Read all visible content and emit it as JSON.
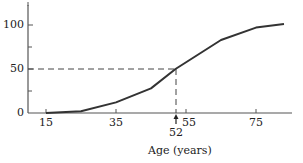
{
  "chart_data": {
    "type": "line",
    "title": "",
    "xlabel": "Age (years)",
    "ylabel": "",
    "xlim": [
      15,
      83
    ],
    "ylim": [
      0,
      100
    ],
    "x_ticks": [
      15,
      35,
      55,
      75
    ],
    "y_ticks": [
      0,
      50,
      100
    ],
    "grid": false,
    "legend": null,
    "series": [
      {
        "name": "cumulative",
        "x": [
          15,
          25,
          35,
          45,
          52,
          65,
          75,
          83
        ],
        "y": [
          0,
          2,
          12,
          28,
          50,
          83,
          97,
          101
        ]
      }
    ],
    "annotations": [
      {
        "type": "dashed-reference",
        "x": 52,
        "y": 50,
        "label": "52",
        "marker": "arrow-up"
      }
    ]
  },
  "axes": {
    "y_tick_labels": [
      "100",
      "50",
      "0"
    ],
    "x_tick_labels": [
      "15",
      "35",
      "55",
      "75"
    ],
    "annotation_label": "52",
    "xlabel": "Age (years)"
  }
}
